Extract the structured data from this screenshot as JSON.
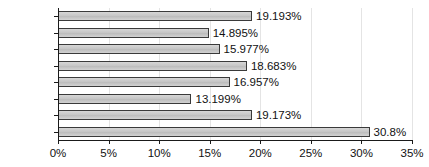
{
  "chart_data": {
    "type": "bar",
    "orientation": "horizontal",
    "title": "",
    "subtitle": "",
    "xlabel": "",
    "ylabel": "",
    "categories": [
      "WLD",
      "SSA",
      "SAS",
      "OECD",
      "NOECD",
      "MENA",
      "LAC",
      "EAP"
    ],
    "values": [
      19.193,
      14.895,
      15.977,
      18.683,
      16.957,
      13.199,
      19.173,
      30.8
    ],
    "value_labels": [
      "19.193%",
      "14.895%",
      "15.977%",
      "18.683%",
      "16.957%",
      "13.199%",
      "19.173%",
      "30.8%"
    ],
    "xlim": [
      0,
      35
    ],
    "xticks": [
      0,
      5,
      10,
      15,
      20,
      25,
      30,
      35
    ],
    "xtick_labels": [
      "0%",
      "5%",
      "10%",
      "15%",
      "20%",
      "25%",
      "30%",
      "35%"
    ],
    "grid": "vertical",
    "legend": null,
    "bar_fill_color": "#c9c9c9",
    "bar_border_color": "#3a3a3a",
    "gridline_color": "#e4e4e4",
    "axis_color": "#1a1a1a",
    "text_color": "#111111"
  }
}
